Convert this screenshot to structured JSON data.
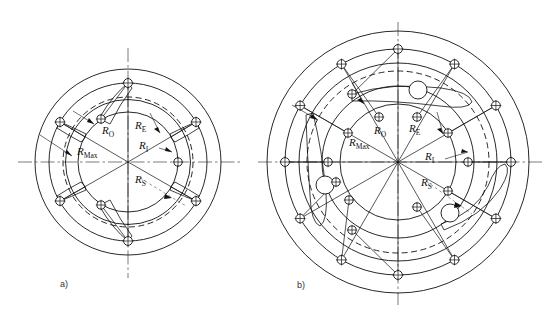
{
  "figure": {
    "background_color": "#ffffff",
    "line_color": "#111111",
    "panels": [
      {
        "id": "a",
        "caption": "a)",
        "caption_x": 60,
        "caption_y": 287,
        "center": {
          "x": 128,
          "y": 162
        },
        "rings": [
          {
            "name": "R_Max",
            "radius": 93,
            "style": "solid"
          },
          {
            "name": "R_O",
            "radius": 79,
            "style": "solid"
          },
          {
            "name": "R_E",
            "radius": 65,
            "style": "dashed"
          },
          {
            "name": "R_I",
            "radius": 50,
            "style": "solid"
          },
          {
            "name": "R_S",
            "radius": 62,
            "style": "solid"
          }
        ],
        "outer_node_ring_radius": 79,
        "inner_node_ring_radius": 50,
        "node_count": 6,
        "node_radius": 4.2,
        "labels": [
          {
            "text": "R",
            "sub": "O",
            "x": 105,
            "y": 131
          },
          {
            "text": "R",
            "sub": "E",
            "x": 138,
            "y": 126
          },
          {
            "text": "R",
            "sub": "Max",
            "x": 82,
            "y": 152
          },
          {
            "text": "R",
            "sub": "I",
            "x": 141,
            "y": 146
          },
          {
            "text": "R",
            "sub": "S",
            "x": 137,
            "y": 180
          }
        ]
      },
      {
        "id": "b",
        "caption": "b)",
        "caption_x": 297,
        "caption_y": 288,
        "center": {
          "x": 398,
          "y": 162
        },
        "rings": [
          {
            "name": "R_Max",
            "radius": 131,
            "style": "solid"
          },
          {
            "name": "R_O",
            "radius": 113,
            "style": "solid"
          },
          {
            "name": "R_E",
            "radius": 95,
            "style": "dashed"
          },
          {
            "name": "R_I",
            "radius": 76,
            "style": "solid"
          },
          {
            "name": "R_S",
            "radius": 58,
            "style": "solid"
          }
        ],
        "outer_node_ring_radius": 113,
        "mid_node_ring_radius": 95,
        "inner_node_ring_radius": 76,
        "node_count": 12,
        "node_radius": 4.2,
        "labels": [
          {
            "text": "R",
            "sub": "O",
            "x": 378,
            "y": 131
          },
          {
            "text": "R",
            "sub": "E",
            "x": 412,
            "y": 129
          },
          {
            "text": "R",
            "sub": "Max",
            "x": 354,
            "y": 143
          },
          {
            "text": "R",
            "sub": "I",
            "x": 427,
            "y": 157
          },
          {
            "text": "R",
            "sub": "S",
            "x": 423,
            "y": 183
          }
        ]
      }
    ]
  }
}
